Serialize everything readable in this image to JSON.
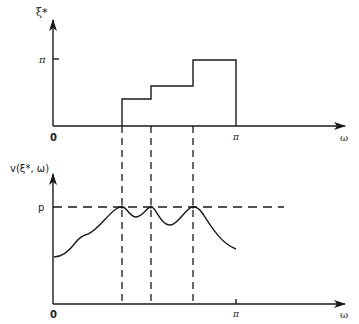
{
  "top_plot": {
    "y_label": "ξ*",
    "x_label": "ω",
    "origin_label": "0",
    "y_tick_label": "π",
    "x_tick_label": "π",
    "steps": [
      {
        "x_start": 122,
        "x_end": 151,
        "y": 99
      },
      {
        "x_start": 151,
        "x_end": 193,
        "y": 86
      },
      {
        "x_start": 193,
        "x_end": 236,
        "y": 60
      }
    ]
  },
  "bottom_plot": {
    "y_label": "v(ξ*, ω)",
    "x_label": "ω",
    "origin_label": "0",
    "level_label": "p",
    "x_tick_label": "π"
  },
  "dashed_verticals_x": [
    122,
    151,
    193
  ],
  "colors": {
    "line": "#1a1a1a",
    "background": "#ffffff"
  }
}
